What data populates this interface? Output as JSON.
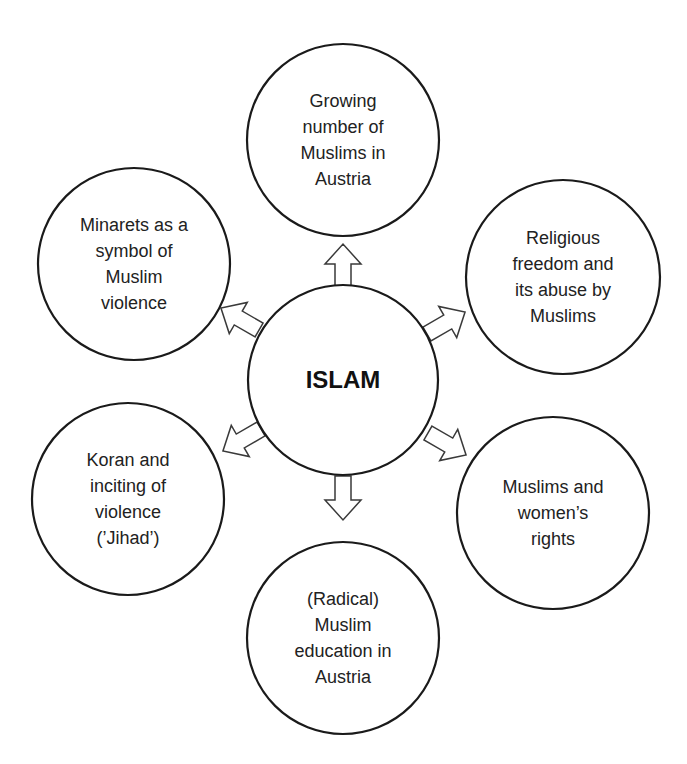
{
  "center": {
    "label": "ISLAM",
    "cx": 343,
    "cy": 380,
    "r": 95
  },
  "nodes": [
    {
      "id": "top",
      "label": "Growing\nnumber of\nMuslims in\nAustria",
      "cx": 343,
      "cy": 140,
      "r": 96
    },
    {
      "id": "upper-right",
      "label": "Religious\nfreedom and\nits abuse by\nMuslims",
      "cx": 563,
      "cy": 277,
      "r": 97
    },
    {
      "id": "lower-right",
      "label": "Muslims and\nwomen’s\nrights",
      "cx": 553,
      "cy": 513,
      "r": 96
    },
    {
      "id": "bottom",
      "label": "(Radical)\nMuslim\neducation in\nAustria",
      "cx": 343,
      "cy": 638,
      "r": 96
    },
    {
      "id": "lower-left",
      "label": "Koran and\ninciting of\nviolence\n(’Jihad’)",
      "cx": 128,
      "cy": 499,
      "r": 96
    },
    {
      "id": "upper-left",
      "label": "Minarets as a\nsymbol of\nMuslim\nviolence",
      "cx": 134,
      "cy": 264,
      "r": 96
    }
  ],
  "arrows": [
    {
      "id": "to-top",
      "angle": -90,
      "x": 343,
      "y": 266
    },
    {
      "id": "to-upper-right",
      "angle": -30,
      "x": 446,
      "y": 323
    },
    {
      "id": "to-lower-right",
      "angle": 30,
      "x": 447,
      "y": 444
    },
    {
      "id": "to-bottom",
      "angle": 90,
      "x": 343,
      "y": 498
    },
    {
      "id": "to-lower-left",
      "angle": 150,
      "x": 242,
      "y": 440
    },
    {
      "id": "to-upper-left",
      "angle": 210,
      "x": 240,
      "y": 319
    }
  ],
  "colors": {
    "stroke": "#1a1a1a",
    "text": "#222222",
    "background": "#ffffff"
  }
}
